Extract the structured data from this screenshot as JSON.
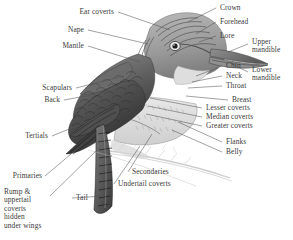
{
  "figure": {
    "type": "anatomical-diagram",
    "background_color": "#ffffff",
    "ink_color": "#3a3a3a",
    "width": 293,
    "height": 240
  },
  "labels": {
    "ear_coverts": "Ear coverts",
    "nape": "Nape",
    "mantle": "Mantle",
    "scapulars": "Scapulars",
    "back": "Back",
    "tertials": "Tertials",
    "primaries": "Primaries",
    "rump_block": "Rump &\nuppertail\ncoverts\nhidden\nunder wings",
    "tail": "Tail",
    "crown": "Crown",
    "forehead": "Forehead",
    "lore": "Lore",
    "upper_mandible": "Upper\nmandible",
    "lower_mandible": "Lower\nmandible",
    "chin": "Chin",
    "neck": "Neck",
    "throat": "Throat",
    "breast": "Breast",
    "lesser_coverts": "Lesser coverts",
    "median_coverts": "Median coverts",
    "greater_coverts": "Greater coverts",
    "flanks": "Flanks",
    "belly": "Belly",
    "secondaries": "Secondaries",
    "undertail_coverts": "Undertail coverts"
  }
}
